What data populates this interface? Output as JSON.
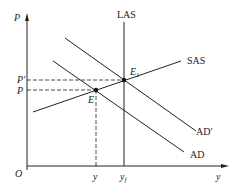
{
  "diagram": {
    "type": "AS-AD economics diagram",
    "axes": {
      "y_label": "P",
      "x_label": "y",
      "origin_label": "O"
    },
    "curves": {
      "las": "LAS",
      "sas": "SAS",
      "ad": "AD",
      "ad_prime": "AD′"
    },
    "points": {
      "e": "E",
      "e1": "E",
      "e1_sub": "1"
    },
    "price_levels": {
      "p": "P",
      "p_prime": "P′"
    },
    "output_levels": {
      "y": "y",
      "yf": "y",
      "yf_sub": "f"
    }
  },
  "colors": {
    "line": "#222222",
    "background": "#ffffff"
  }
}
